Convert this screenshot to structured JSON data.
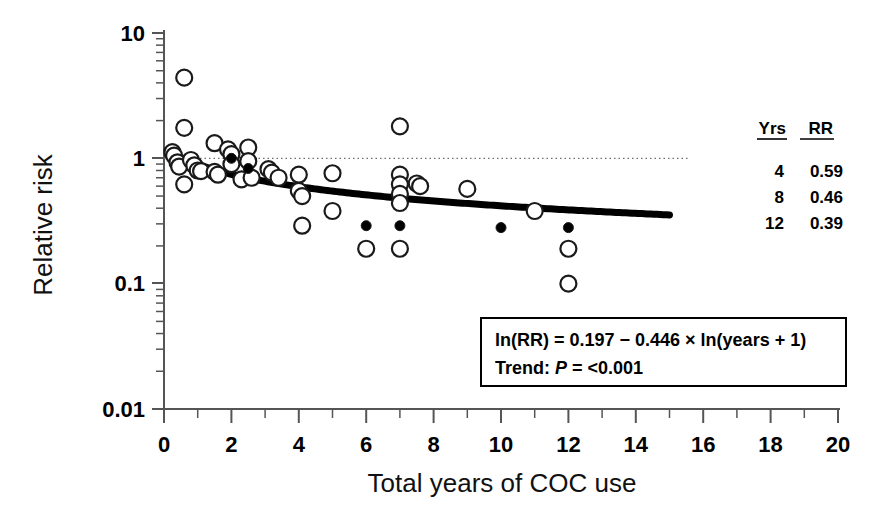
{
  "chart_data": {
    "type": "scatter",
    "title": "",
    "xlabel": "Total years of COC use",
    "ylabel": "Relative risk",
    "xlim": [
      0,
      20
    ],
    "ylim": [
      0.01,
      10
    ],
    "yscale": "log",
    "grid": false,
    "legend_position": "right",
    "xticks": [
      0,
      2,
      4,
      6,
      8,
      10,
      12,
      14,
      16,
      18,
      20
    ],
    "xtick_labels": [
      "0",
      "2",
      "4",
      "6",
      "8",
      "10",
      "12",
      "14",
      "16",
      "18",
      "20"
    ],
    "xminor_ticks": [
      1,
      3,
      5,
      7,
      9,
      11,
      13,
      15,
      17,
      19
    ],
    "yticks": [
      0.01,
      0.1,
      1,
      10
    ],
    "ytick_labels": [
      "0.01",
      "0.1",
      "1",
      "10"
    ],
    "reference_line": {
      "y": 1,
      "style": "dotted",
      "x_start": 0,
      "x_end": 15.6
    },
    "series": [
      {
        "name": "Open circles",
        "marker": "open-circle",
        "points": [
          {
            "x": 0.25,
            "y": 1.12
          },
          {
            "x": 0.3,
            "y": 1.05
          },
          {
            "x": 0.4,
            "y": 0.93
          },
          {
            "x": 0.45,
            "y": 0.86
          },
          {
            "x": 0.6,
            "y": 4.4
          },
          {
            "x": 0.6,
            "y": 1.75
          },
          {
            "x": 0.6,
            "y": 0.62
          },
          {
            "x": 0.8,
            "y": 0.97
          },
          {
            "x": 0.9,
            "y": 0.88
          },
          {
            "x": 1.0,
            "y": 0.8
          },
          {
            "x": 1.1,
            "y": 0.79
          },
          {
            "x": 1.5,
            "y": 1.32
          },
          {
            "x": 1.5,
            "y": 0.78
          },
          {
            "x": 1.6,
            "y": 0.74
          },
          {
            "x": 1.9,
            "y": 1.18
          },
          {
            "x": 2.0,
            "y": 1.08
          },
          {
            "x": 2.0,
            "y": 0.9
          },
          {
            "x": 2.3,
            "y": 0.68
          },
          {
            "x": 2.5,
            "y": 1.22
          },
          {
            "x": 2.5,
            "y": 0.95
          },
          {
            "x": 2.6,
            "y": 0.7
          },
          {
            "x": 3.1,
            "y": 0.82
          },
          {
            "x": 3.2,
            "y": 0.77
          },
          {
            "x": 3.4,
            "y": 0.7
          },
          {
            "x": 4.0,
            "y": 0.74
          },
          {
            "x": 4.0,
            "y": 0.55
          },
          {
            "x": 4.1,
            "y": 0.5
          },
          {
            "x": 4.1,
            "y": 0.29
          },
          {
            "x": 5.0,
            "y": 0.76
          },
          {
            "x": 5.0,
            "y": 0.38
          },
          {
            "x": 6.0,
            "y": 0.19
          },
          {
            "x": 7.0,
            "y": 1.8
          },
          {
            "x": 7.0,
            "y": 0.74
          },
          {
            "x": 7.0,
            "y": 0.62
          },
          {
            "x": 7.0,
            "y": 0.52
          },
          {
            "x": 7.0,
            "y": 0.44
          },
          {
            "x": 7.0,
            "y": 0.19
          },
          {
            "x": 7.5,
            "y": 0.63
          },
          {
            "x": 7.6,
            "y": 0.6
          },
          {
            "x": 9.0,
            "y": 0.57
          },
          {
            "x": 11.0,
            "y": 0.38
          },
          {
            "x": 12.0,
            "y": 0.19
          },
          {
            "x": 12.0,
            "y": 0.1
          }
        ]
      },
      {
        "name": "Filled circles",
        "marker": "filled-circle",
        "points": [
          {
            "x": 2.0,
            "y": 1.0
          },
          {
            "x": 2.5,
            "y": 0.83
          },
          {
            "x": 6.0,
            "y": 0.29
          },
          {
            "x": 7.0,
            "y": 0.29
          },
          {
            "x": 10.0,
            "y": 0.28
          },
          {
            "x": 12.0,
            "y": 0.28
          }
        ]
      }
    ],
    "fit_curve": {
      "name": "Fitted trend",
      "formula": "ln(RR) = 0.197 - 0.446 * ln(years + 1)",
      "intercept": 0.197,
      "slope": -0.446,
      "x_start": 0.1,
      "x_end": 15.0,
      "style": "thick-solid"
    }
  },
  "legend_table": {
    "headers": [
      "Yrs",
      "RR"
    ],
    "rows": [
      {
        "yrs": "4",
        "rr": "0.59"
      },
      {
        "yrs": "8",
        "rr": "0.46"
      },
      {
        "yrs": "12",
        "rr": "0.39"
      }
    ]
  },
  "annotation_box": {
    "equation_parts": {
      "lead": "ln(RR) = 0.197 ",
      "minus": "−",
      "coefficient": " 0.446 ",
      "times": "×",
      "tail": " ln(years + 1)"
    },
    "equation_full": "ln(RR) = 0.197 − 0.446 × ln(years + 1)",
    "trend_label": "Trend: ",
    "trend_p_symbol": "P",
    "trend_value": " = <0.001"
  },
  "colors": {
    "axis": "#4a4a4a",
    "marker_stroke": "#1a1a1a",
    "marker_fill": "#000000",
    "curve": "#000000",
    "reference_line": "#6e6e6e",
    "text": "#000000",
    "background": "#ffffff"
  }
}
